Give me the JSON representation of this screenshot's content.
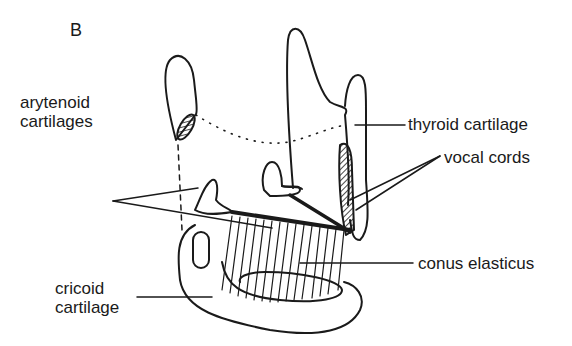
{
  "figure": {
    "panel_letter": "B",
    "labels": {
      "arytenoid": [
        "arytenoid",
        "cartilages"
      ],
      "thyroid": "thyroid cartilage",
      "vocal": "vocal cords",
      "conus": "conus elasticus",
      "cricoid": [
        "cricoid",
        "cartilage"
      ]
    },
    "colors": {
      "ink": "#1a1a1a",
      "background": "#ffffff"
    }
  }
}
